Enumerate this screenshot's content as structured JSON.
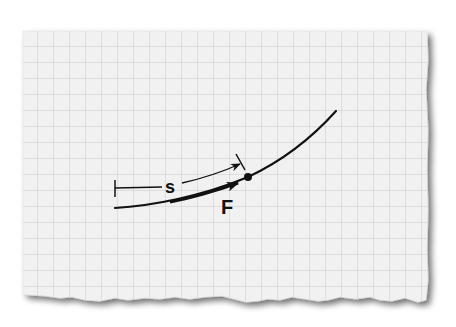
{
  "diagram": {
    "paper": {
      "color": "#f1f1f1",
      "grid_color": "#c9c9c9",
      "grid_spacing_px": 16,
      "edge": "torn bottom edge with drop shadow"
    },
    "labels": {
      "displacement": "s",
      "force": "F"
    },
    "elements": [
      {
        "type": "curve",
        "name": "path",
        "description": "curved trajectory rising to the right"
      },
      {
        "type": "dimension-arrow",
        "name": "displacement-s",
        "label": "s",
        "description": "arc-length displacement from start tick to point"
      },
      {
        "type": "vector",
        "name": "force-F",
        "label": "F",
        "description": "thick arrow tangent to path before the point"
      },
      {
        "type": "point",
        "name": "particle-point",
        "description": "filled dot on the path"
      }
    ],
    "colors": {
      "ink": "#111111"
    }
  }
}
